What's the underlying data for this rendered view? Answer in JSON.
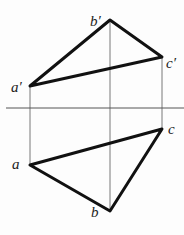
{
  "diagram": {
    "colors": {
      "edge": "#111111",
      "projector": "#555555",
      "axis": "#555555",
      "label": "#222222"
    },
    "axis": {
      "label": "",
      "y": 108,
      "x1": 6,
      "x2": 184
    },
    "front_view": {
      "points": {
        "a_prime": {
          "label": "a′",
          "x": 30,
          "y": 86
        },
        "b_prime": {
          "label": "b′",
          "x": 110,
          "y": 20
        },
        "c_prime": {
          "label": "c′",
          "x": 162,
          "y": 57
        }
      }
    },
    "top_view": {
      "points": {
        "a": {
          "label": "a",
          "x": 30,
          "y": 165
        },
        "b": {
          "label": "b",
          "x": 110,
          "y": 211
        },
        "c": {
          "label": "c",
          "x": 162,
          "y": 129
        }
      }
    }
  }
}
